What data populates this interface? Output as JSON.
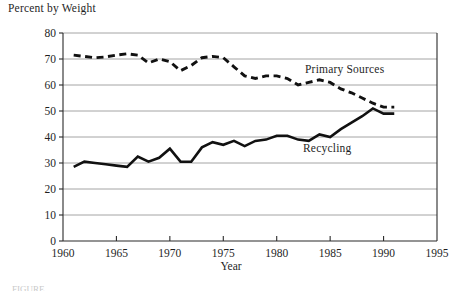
{
  "figure": {
    "title": "Percent by Weight",
    "caption_partial": "FIGURE"
  },
  "axes": {
    "y_ticks": [
      "0",
      "10",
      "20",
      "30",
      "40",
      "50",
      "60",
      "70",
      "80"
    ],
    "x_ticks": [
      "1960",
      "1965",
      "1970",
      "1975",
      "1980",
      "1985",
      "1990",
      "1995"
    ],
    "x_title": "Year",
    "y_title": "Percent by Weight"
  },
  "labels": {
    "primary_sources": "Primary Sources",
    "recycling": "Recycling"
  },
  "colors": {
    "line": "#111111",
    "grid": "#8e8e8e",
    "axis": "#2a2a2a",
    "background": "#ffffff",
    "text": "#1f1f1f"
  },
  "chart_data": {
    "type": "line",
    "title": "Percent by Weight",
    "xlabel": "Year",
    "ylabel": "Percent by Weight",
    "xlim": [
      1960,
      1995
    ],
    "ylim": [
      0,
      80
    ],
    "ytick_step": 10,
    "xtick_step": 5,
    "grid": "horizontal",
    "legend": "inline-annotations",
    "series": [
      {
        "name": "Primary Sources",
        "style": "dashed",
        "x": [
          1961,
          1962,
          1963,
          1964,
          1965,
          1966,
          1967,
          1968,
          1969,
          1970,
          1971,
          1972,
          1973,
          1974,
          1975,
          1976,
          1977,
          1978,
          1979,
          1980,
          1981,
          1982,
          1983,
          1984,
          1985,
          1986,
          1987,
          1988,
          1989,
          1990,
          1991
        ],
        "values": [
          71.5,
          71.0,
          70.5,
          70.8,
          71.5,
          72.0,
          71.5,
          68.5,
          70.0,
          69.0,
          65.5,
          67.5,
          70.5,
          71.0,
          70.5,
          67.0,
          63.5,
          62.5,
          63.5,
          63.5,
          62.5,
          60.0,
          61.0,
          62.0,
          61.0,
          58.5,
          57.0,
          55.0,
          53.0,
          51.5,
          51.5
        ]
      },
      {
        "name": "Recycling",
        "style": "solid",
        "x": [
          1961,
          1962,
          1963,
          1964,
          1965,
          1966,
          1967,
          1968,
          1969,
          1970,
          1971,
          1972,
          1973,
          1974,
          1975,
          1976,
          1977,
          1978,
          1979,
          1980,
          1981,
          1982,
          1983,
          1984,
          1985,
          1986,
          1987,
          1988,
          1989,
          1990,
          1991
        ],
        "values": [
          28.5,
          30.5,
          30.0,
          29.5,
          29.0,
          28.5,
          32.5,
          30.5,
          32.0,
          35.5,
          30.5,
          30.5,
          36.0,
          38.0,
          37.0,
          38.5,
          36.5,
          38.5,
          39.0,
          40.5,
          40.5,
          39.0,
          38.5,
          41.0,
          40.0,
          43.0,
          45.5,
          48.0,
          51.0,
          49.0,
          49.0
        ]
      }
    ]
  }
}
